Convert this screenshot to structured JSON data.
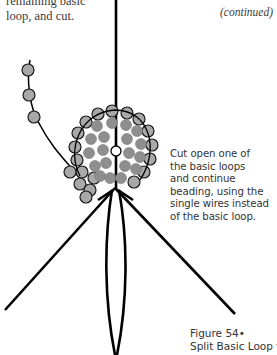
{
  "page": {
    "top_note": [
      "remaining basic",
      "loop, and cut."
    ],
    "continued_label": "(continued)",
    "instruction_lines": [
      "Cut open one of",
      "the basic loops",
      "and continue",
      "beading, using the",
      "single wires instead",
      "of the basic loop."
    ],
    "figure_caption": {
      "number": "Figure 54•",
      "title": "Split Basic Loop for Leaf"
    }
  },
  "figure": {
    "colors": {
      "wire": "#000000",
      "bead_fill": "#a8a8a8",
      "bead_inner": "#8e8e8e",
      "bead_outline": "#1a1a1a"
    }
  }
}
